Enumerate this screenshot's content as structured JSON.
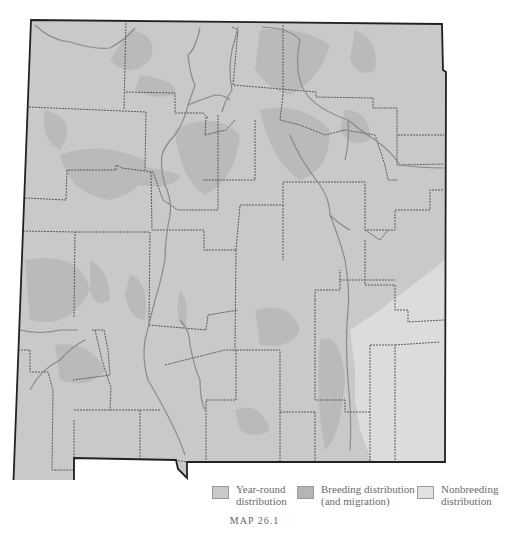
{
  "map": {
    "region": "New Mexico",
    "colors": {
      "year_round": "#c9c9c9",
      "breeding": "#b9b9b9",
      "nonbreeding": "#dcdcdc",
      "county_border": "#5a5a5a",
      "river": "#8a8a8a",
      "state_border": "#222222"
    }
  },
  "legend": {
    "items": [
      {
        "label_line1": "Year-round",
        "label_line2": "distribution",
        "color": "#c9c9c9"
      },
      {
        "label_line1": "Breeding distribution",
        "label_line2": "(and migration)",
        "color": "#b5b5b5"
      },
      {
        "label_line1": "Nonbreeding",
        "label_line2": "distribution",
        "color": "#e2e2e2"
      }
    ]
  },
  "caption": "MAP 26.1"
}
